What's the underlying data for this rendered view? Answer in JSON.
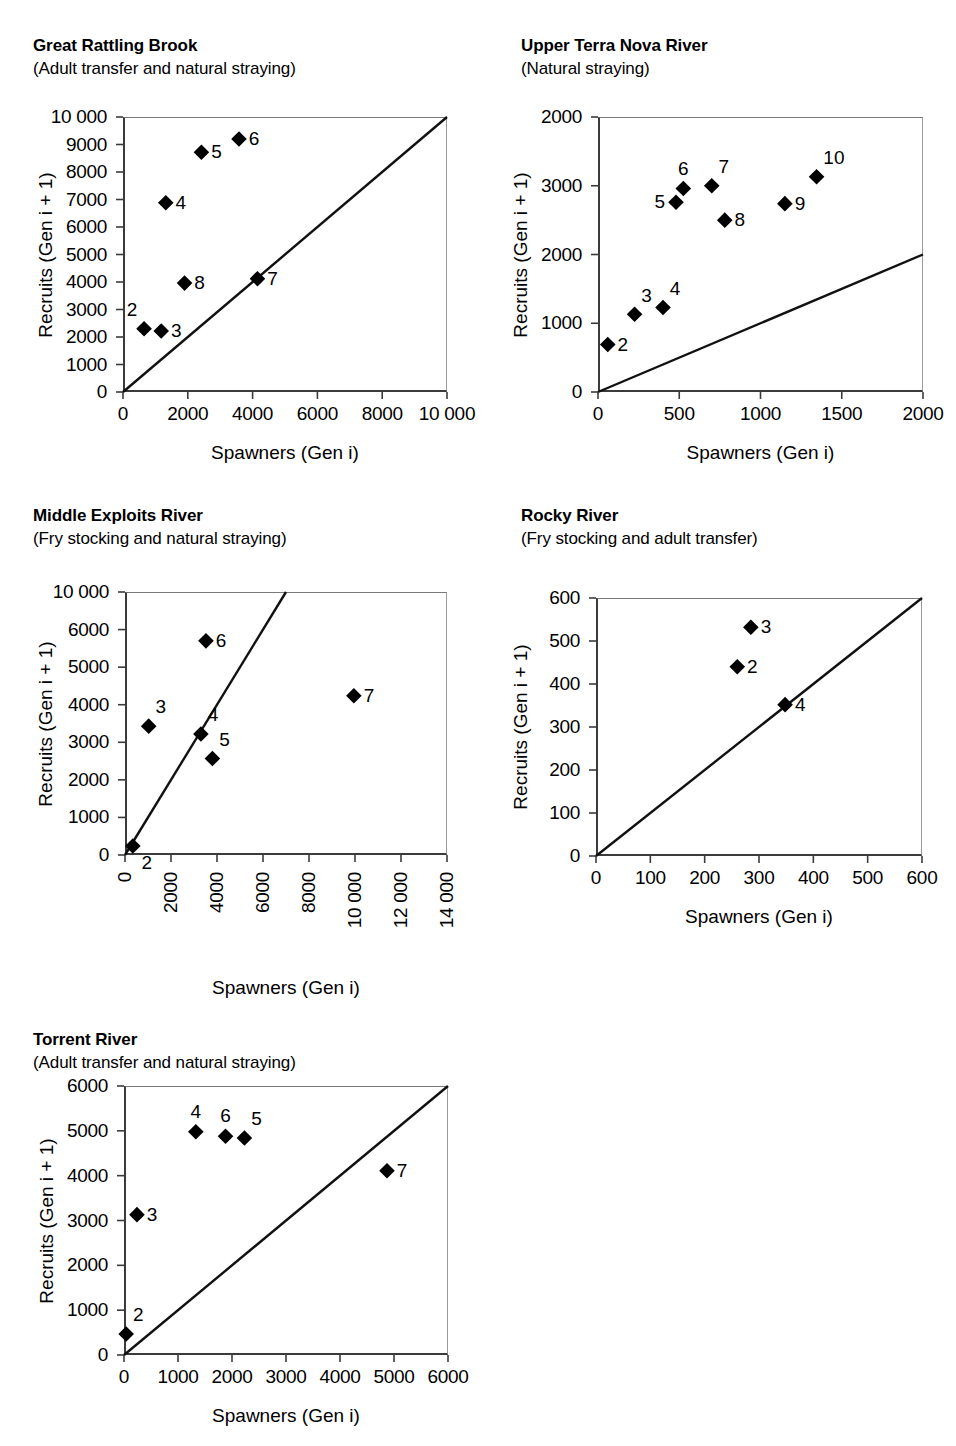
{
  "figure": {
    "axis_titles": {
      "x": "Spawners (Gen i)",
      "y": "Recruits (Gen i + 1)"
    }
  },
  "chart_data": [
    {
      "type": "scatter",
      "title": "Great Rattling Brook",
      "subtitle": "(Adult transfer and natural straying)",
      "xlabel": "Spawners (Gen i)",
      "ylabel": "Recruits (Gen i + 1)",
      "xlim": [
        0,
        10000
      ],
      "ylim": [
        0,
        10000
      ],
      "xticks": [
        0,
        2000,
        4000,
        6000,
        8000,
        10000
      ],
      "xtick_labels": [
        "0",
        "2000",
        "4000",
        "6000",
        "8000",
        "10 000"
      ],
      "yticks": [
        0,
        1000,
        2000,
        3000,
        4000,
        5000,
        6000,
        7000,
        8000,
        9000,
        10000
      ],
      "ytick_labels": [
        "0",
        "1000",
        "2000",
        "3000",
        "4000",
        "5000",
        "6000",
        "7000",
        "8000",
        "9000",
        "10 000"
      ],
      "xtick_rotated": false,
      "grid": false,
      "reference_line": "1:1 replacement line",
      "points": [
        {
          "label": "2",
          "x": 650,
          "y": 2300,
          "label_pos": "above-left"
        },
        {
          "label": "3",
          "x": 1180,
          "y": 2220,
          "label_pos": "right"
        },
        {
          "label": "4",
          "x": 1320,
          "y": 6880,
          "label_pos": "right"
        },
        {
          "label": "5",
          "x": 2420,
          "y": 8720,
          "label_pos": "right"
        },
        {
          "label": "6",
          "x": 3580,
          "y": 9200,
          "label_pos": "right"
        },
        {
          "label": "7",
          "x": 4150,
          "y": 4120,
          "label_pos": "right"
        },
        {
          "label": "8",
          "x": 1900,
          "y": 3960,
          "label_pos": "right"
        }
      ]
    },
    {
      "type": "scatter",
      "title": "Upper Terra Nova River",
      "subtitle": "(Natural straying)",
      "xlabel": "Spawners (Gen i)",
      "ylabel": "Recruits (Gen i + 1)",
      "xlim": [
        0,
        2000
      ],
      "ylim": [
        0,
        4000
      ],
      "xticks": [
        0,
        500,
        1000,
        1500,
        2000
      ],
      "xtick_labels": [
        "0",
        "500",
        "1000",
        "1500",
        "2000"
      ],
      "yticks": [
        0,
        1000,
        2000,
        3000,
        4000
      ],
      "ytick_labels": [
        "0",
        "1000",
        "2000",
        "3000",
        "2000"
      ],
      "xtick_rotated": false,
      "grid": false,
      "reference_line": "1:1 replacement line",
      "points": [
        {
          "label": "2",
          "x": 60,
          "y": 690,
          "label_pos": "right"
        },
        {
          "label": "3",
          "x": 225,
          "y": 1130,
          "label_pos": "above-right"
        },
        {
          "label": "4",
          "x": 400,
          "y": 1230,
          "label_pos": "above-right"
        },
        {
          "label": "5",
          "x": 480,
          "y": 2760,
          "label_pos": "left"
        },
        {
          "label": "6",
          "x": 525,
          "y": 2960,
          "label_pos": "above"
        },
        {
          "label": "7",
          "x": 700,
          "y": 3000,
          "label_pos": "above-right"
        },
        {
          "label": "8",
          "x": 780,
          "y": 2500,
          "label_pos": "right"
        },
        {
          "label": "9",
          "x": 1150,
          "y": 2740,
          "label_pos": "right"
        },
        {
          "label": "10",
          "x": 1345,
          "y": 3130,
          "label_pos": "above-right"
        }
      ]
    },
    {
      "type": "scatter",
      "title": "Middle Exploits River",
      "subtitle": "(Fry stocking and natural straying)",
      "xlabel": "Spawners (Gen i)",
      "ylabel": "Recruits (Gen i + 1)",
      "xlim": [
        0,
        14000
      ],
      "ylim": [
        0,
        7000
      ],
      "xticks": [
        0,
        2000,
        4000,
        6000,
        8000,
        10000,
        12000,
        14000
      ],
      "xtick_labels": [
        "0",
        "2000",
        "4000",
        "6000",
        "8000",
        "10 000",
        "12 000",
        "14 000"
      ],
      "yticks": [
        0,
        1000,
        2000,
        3000,
        4000,
        5000,
        6000,
        7000
      ],
      "ytick_labels": [
        "0",
        "1000",
        "2000",
        "3000",
        "4000",
        "5000",
        "6000",
        "10 000"
      ],
      "xtick_rotated": true,
      "grid": false,
      "reference_line": "1:1 replacement line",
      "points": [
        {
          "label": "2",
          "x": 340,
          "y": 240,
          "label_pos": "below-right"
        },
        {
          "label": "3",
          "x": 1030,
          "y": 3430,
          "label_pos": "above-right"
        },
        {
          "label": "4",
          "x": 3300,
          "y": 3220,
          "label_pos": "above-right"
        },
        {
          "label": "5",
          "x": 3800,
          "y": 2570,
          "label_pos": "above-right"
        },
        {
          "label": "6",
          "x": 3520,
          "y": 5700,
          "label_pos": "right"
        },
        {
          "label": "7",
          "x": 9950,
          "y": 4240,
          "label_pos": "right"
        }
      ]
    },
    {
      "type": "scatter",
      "title": "Rocky River",
      "subtitle": "(Fry stocking and adult transfer)",
      "xlabel": "Spawners (Gen i)",
      "ylabel": "Recruits (Gen i + 1)",
      "xlim": [
        0,
        600
      ],
      "ylim": [
        0,
        600
      ],
      "xticks": [
        0,
        100,
        200,
        300,
        400,
        500,
        600
      ],
      "xtick_labels": [
        "0",
        "100",
        "200",
        "300",
        "400",
        "500",
        "600"
      ],
      "yticks": [
        0,
        100,
        200,
        300,
        400,
        500,
        600
      ],
      "ytick_labels": [
        "0",
        "100",
        "200",
        "300",
        "400",
        "500",
        "600"
      ],
      "xtick_rotated": false,
      "grid": false,
      "reference_line": "1:1 replacement line",
      "points": [
        {
          "label": "2",
          "x": 260,
          "y": 440,
          "label_pos": "right"
        },
        {
          "label": "3",
          "x": 285,
          "y": 532,
          "label_pos": "right"
        },
        {
          "label": "4",
          "x": 348,
          "y": 352,
          "label_pos": "right"
        }
      ]
    },
    {
      "type": "scatter",
      "title": "Torrent River",
      "subtitle": "(Adult transfer and natural straying)",
      "xlabel": "Spawners (Gen i)",
      "ylabel": "Recruits (Gen i + 1)",
      "xlim": [
        0,
        6000
      ],
      "ylim": [
        0,
        6000
      ],
      "xticks": [
        0,
        1000,
        2000,
        3000,
        4000,
        5000,
        6000
      ],
      "xtick_labels": [
        "0",
        "1000",
        "2000",
        "3000",
        "4000",
        "5000",
        "6000"
      ],
      "yticks": [
        0,
        1000,
        2000,
        3000,
        4000,
        5000,
        6000
      ],
      "ytick_labels": [
        "0",
        "1000",
        "2000",
        "3000",
        "4000",
        "5000",
        "6000"
      ],
      "xtick_rotated": false,
      "grid": false,
      "reference_line": "1:1 replacement line",
      "points": [
        {
          "label": "2",
          "x": 40,
          "y": 470,
          "label_pos": "above-right"
        },
        {
          "label": "3",
          "x": 240,
          "y": 3130,
          "label_pos": "right"
        },
        {
          "label": "4",
          "x": 1330,
          "y": 4980,
          "label_pos": "above"
        },
        {
          "label": "5",
          "x": 2230,
          "y": 4840,
          "label_pos": "above-right"
        },
        {
          "label": "6",
          "x": 1880,
          "y": 4880,
          "label_pos": "above"
        },
        {
          "label": "7",
          "x": 4870,
          "y": 4110,
          "label_pos": "right"
        }
      ]
    }
  ]
}
